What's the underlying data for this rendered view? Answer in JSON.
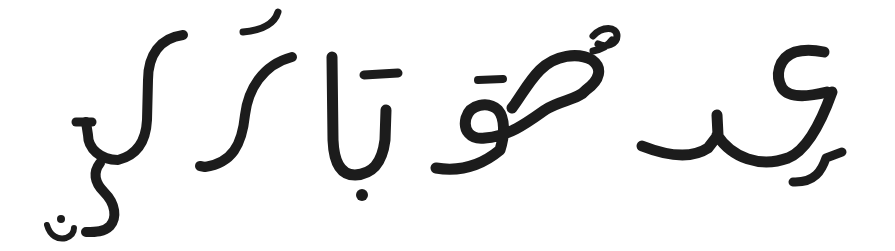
{
  "image": {
    "description": "Handwritten calligraphic Arabic-script style glyphs in black ink on white background",
    "ink_color": "#1c1c1c",
    "background_color": "#ffffff",
    "glyph_groups": [
      {
        "id": "group-1",
        "label": "leftmost glyph with dotted crescent below"
      },
      {
        "id": "group-2",
        "label": "curved stroke with fatha-like mark above"
      },
      {
        "id": "group-3",
        "label": "alef-like vertical with bar, dot below"
      },
      {
        "id": "group-4",
        "label": "loop glyph with bar and damma above"
      },
      {
        "id": "group-5",
        "label": "rightmost ain-like connected glyph with tail"
      }
    ]
  }
}
